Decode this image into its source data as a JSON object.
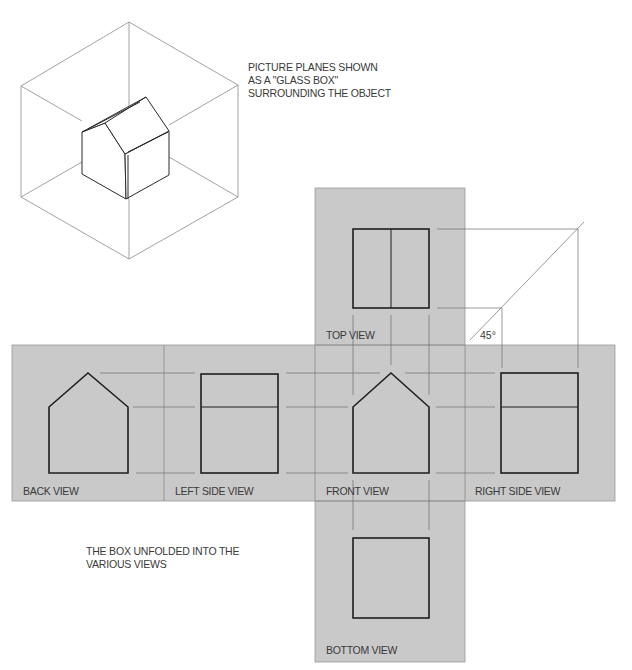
{
  "captions": {
    "glass_box": [
      "PICTURE PLANES SHOWN",
      "AS A \"GLASS BOX\"",
      "SURROUNDING THE OBJECT"
    ],
    "unfolded": [
      "THE BOX UNFOLDED INTO THE",
      "VARIOUS VIEWS"
    ]
  },
  "views": {
    "top": "TOP VIEW",
    "back": "BACK VIEW",
    "left": "LEFT SIDE VIEW",
    "front": "FRONT VIEW",
    "right": "RIGHT SIDE VIEW",
    "bottom": "BOTTOM VIEW"
  },
  "miter_angle": "45°",
  "colors": {
    "panel": "#c9c9c9",
    "panel_edge": "#9a9a9a",
    "object_line": "#1f1f1f",
    "projection_line": "#6e6e6e",
    "glass_box_line": "#8a8a8a"
  }
}
